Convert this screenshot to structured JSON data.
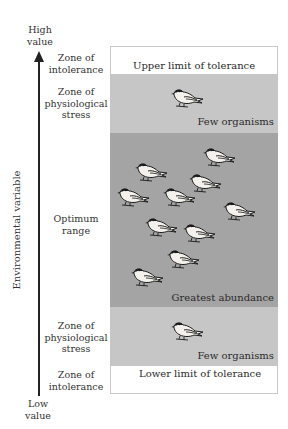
{
  "axis": {
    "high_label": [
      "High",
      "value"
    ],
    "low_label": [
      "Low",
      "value"
    ],
    "title": "Environmental variable"
  },
  "zones": [
    {
      "id": "upper-intolerance",
      "label": [
        "Zone of",
        "intolerance"
      ],
      "inner_text": "Upper limit of tolerance",
      "fill": "#ffffff",
      "birds": 0
    },
    {
      "id": "upper-stress",
      "label": [
        "Zone of",
        "physiological",
        "stress"
      ],
      "inner_text": "Few organisms",
      "fill": "#c6c6c6",
      "birds": 1
    },
    {
      "id": "optimum",
      "label": [
        "Optimum",
        "range"
      ],
      "inner_text": "Greatest abundance",
      "fill": "#a4a4a4",
      "birds": 10
    },
    {
      "id": "lower-stress",
      "label": [
        "Zone of",
        "physiological",
        "stress"
      ],
      "inner_text": "Few organisms",
      "fill": "#c6c6c6",
      "birds": 1
    },
    {
      "id": "lower-intolerance",
      "label": [
        "Zone of",
        "intolerance"
      ],
      "inner_text": "Lower limit of tolerance",
      "fill": "#ffffff",
      "birds": 0
    }
  ],
  "icons": {
    "bird": "bird-icon",
    "arrow": "arrow-up-icon"
  }
}
